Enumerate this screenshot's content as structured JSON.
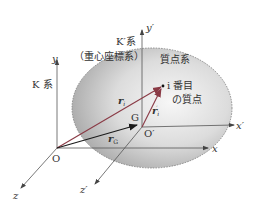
{
  "diagram": {
    "type": "coordinate-systems",
    "colors": {
      "axis": "#555555",
      "vector_ri": "#8a3a45",
      "vector_rG": "#1a1a1a",
      "vector_ri_prime": "#8a3a45",
      "body_light": "#f4f4f4",
      "body_dark": "#a9a9a9",
      "text": "#333333"
    },
    "frames": {
      "K": {
        "label": "K 系",
        "origin_label": "O",
        "axes": {
          "x": "x",
          "y": "y",
          "z": "z"
        }
      },
      "K_prime": {
        "label": "K′系",
        "sublabel": "（重心座標系）",
        "origin_label": "O′",
        "axes": {
          "x": "x′",
          "y": "y′",
          "z": "z′"
        }
      }
    },
    "body": {
      "label": "質点系"
    },
    "particle": {
      "label_line1": "i 番目",
      "label_line2": "の質点",
      "index": "i"
    },
    "center_of_mass": {
      "label": "G"
    },
    "vectors": {
      "ri": {
        "main": "r",
        "sub": "i"
      },
      "rG": {
        "main": "r",
        "sub": "G"
      },
      "ri_prime": {
        "main": "r",
        "sub": "i",
        "prime": "′"
      }
    }
  }
}
